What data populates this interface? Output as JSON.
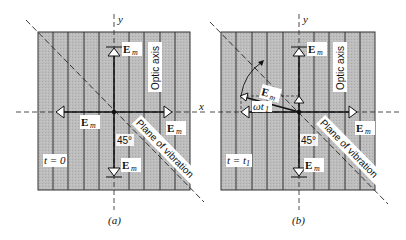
{
  "figure": {
    "axis_x_label": "x",
    "axis_y_label": "y",
    "colors": {
      "panel_fill": "#b8b8b8",
      "grid_line": "#3a3a3a",
      "label_bg": "#ffffff",
      "ink": "#111111"
    },
    "panels": [
      {
        "id": "a",
        "caption": "(a)",
        "time_label": "t = 0",
        "optic_axis_label": "Optic axis",
        "plane_label": "Plane of vibration",
        "angle_label": "45°",
        "vector_label": "E",
        "vector_sub": "m",
        "vector_labels": [
          "top",
          "left",
          "right",
          "bottom"
        ]
      },
      {
        "id": "b",
        "caption": "(b)",
        "time_label": "t = t",
        "time_sub": "1",
        "optic_axis_label": "Optic axis",
        "plane_label": "Plane of vibration",
        "angle_label": "45°",
        "vector_label": "E",
        "vector_sub": "m",
        "rotated_vector_label": "E",
        "rotated_vector_sub": "m",
        "rotation_label": "ωt",
        "rotation_sub": "1",
        "vector_labels": [
          "top",
          "left",
          "right",
          "bottom"
        ]
      }
    ]
  }
}
